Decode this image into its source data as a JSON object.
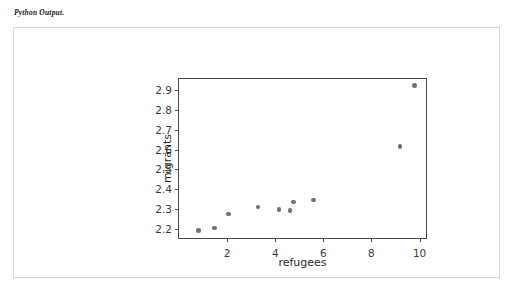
{
  "caption": "Python Output.",
  "chart_data": {
    "type": "scatter",
    "title": "",
    "xlabel": "refugees",
    "ylabel": "migrants",
    "xlim": [
      0,
      10.35
    ],
    "ylim": [
      2.145,
      2.955
    ],
    "xticks": [
      2,
      4,
      6,
      8,
      10
    ],
    "yticks": [
      2.2,
      2.3,
      2.4,
      2.5,
      2.6,
      2.7,
      2.8,
      2.9
    ],
    "xtick_labels": [
      "2",
      "4",
      "6",
      "8",
      "10"
    ],
    "ytick_labels": [
      "2.2",
      "2.3",
      "2.4",
      "2.5",
      "2.6",
      "2.7",
      "2.8",
      "2.9"
    ],
    "grid": false,
    "legend": false,
    "marker_color": "#6f6f6f",
    "marker": "o",
    "points": [
      {
        "x": 0.82,
        "y": 2.192
      },
      {
        "x": 1.48,
        "y": 2.206
      },
      {
        "x": 2.05,
        "y": 2.276
      },
      {
        "x": 3.28,
        "y": 2.311
      },
      {
        "x": 4.15,
        "y": 2.297
      },
      {
        "x": 4.62,
        "y": 2.293
      },
      {
        "x": 4.75,
        "y": 2.336
      },
      {
        "x": 5.58,
        "y": 2.346
      },
      {
        "x": 9.18,
        "y": 2.616
      },
      {
        "x": 9.78,
        "y": 2.922
      }
    ]
  }
}
